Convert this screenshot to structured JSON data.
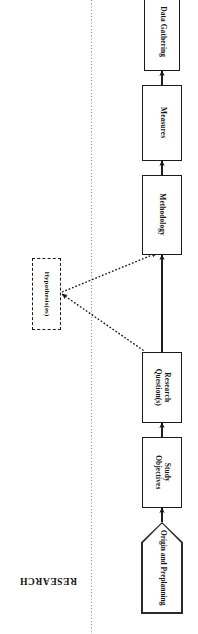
{
  "figure": {
    "orientation": "rotated-180",
    "background": "#ffffff",
    "line_color": "#1a1a1a",
    "band_label": "RESEARCH"
  },
  "nodes": {
    "origin": {
      "label_line1": "Origin and Preplanning",
      "shape": "pentagon-arrow",
      "style": "solid"
    },
    "objectives": {
      "label_line1": "Study",
      "label_line2": "Objectives",
      "shape": "rectangle",
      "style": "solid"
    },
    "questions": {
      "label_line1": "Research",
      "label_line2": "Question(s)",
      "shape": "rectangle",
      "style": "solid"
    },
    "hypotheses": {
      "label_line1": "Hypothesis(es)",
      "shape": "rectangle",
      "style": "dashed"
    },
    "methodology": {
      "label_line1": "Methodology",
      "shape": "rectangle",
      "style": "solid"
    },
    "measures": {
      "label_line1": "Measures",
      "shape": "rectangle",
      "style": "solid"
    },
    "gathering": {
      "label_line1": "Data Gathering",
      "shape": "rectangle",
      "style": "solid"
    }
  },
  "edges": [
    {
      "id": "origin-to-objectives",
      "from": "origin",
      "to": "objectives",
      "style": "solid"
    },
    {
      "id": "objectives-to-questions",
      "from": "objectives",
      "to": "questions",
      "style": "solid"
    },
    {
      "id": "questions-to-methodology",
      "from": "questions",
      "to": "methodology",
      "style": "solid"
    },
    {
      "id": "questions-to-hypotheses",
      "from": "questions",
      "to": "hypotheses",
      "style": "dotted"
    },
    {
      "id": "hypotheses-to-methodology",
      "from": "hypotheses",
      "to": "methodology",
      "style": "dotted"
    },
    {
      "id": "methodology-to-measures",
      "from": "methodology",
      "to": "measures",
      "style": "solid"
    },
    {
      "id": "measures-to-gathering",
      "from": "measures",
      "to": "gathering",
      "style": "solid"
    }
  ]
}
